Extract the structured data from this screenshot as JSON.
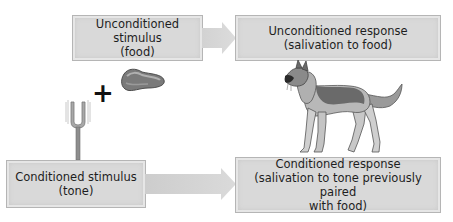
{
  "us_box": {
    "line1": "Unconditioned stimulus",
    "line2": "(food)"
  },
  "ur_box": {
    "line1": "Unconditioned response",
    "line2": "(salivation to food)"
  },
  "cs_box": {
    "line1": "Conditioned stimulus",
    "line2": "(tone)"
  },
  "cr_box": {
    "line1": "Conditioned response",
    "line2": "(salivation to tone previously paired",
    "line3": "with food)"
  },
  "plus_sign": "+",
  "colors": {
    "box_fill": "#d9d9d9",
    "box_border": "#b5b5b5",
    "arrow_fill": "#d4d4d4",
    "text": "#1e1e1e"
  },
  "illustrations": [
    "meat-icon",
    "tuning-fork-icon",
    "dog-icon"
  ]
}
